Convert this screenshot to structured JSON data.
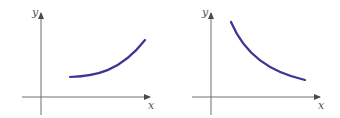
{
  "colors": {
    "axis": "#6e6e6e",
    "curve": "#3a3596",
    "label": "#555555"
  },
  "panels": [
    {
      "name": "increasing-curve",
      "x_label": "x",
      "y_label": "y",
      "curve_description": "increasing, concave up"
    },
    {
      "name": "decreasing-curve",
      "x_label": "x",
      "y_label": "y",
      "curve_description": "decreasing, concave up"
    }
  ]
}
